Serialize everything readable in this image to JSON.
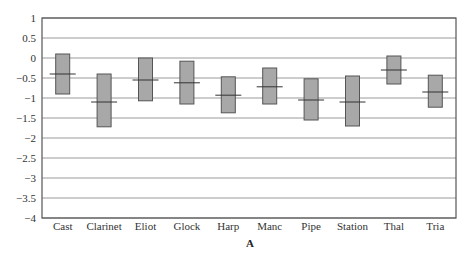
{
  "chart_data": {
    "type": "box",
    "title": "",
    "xlabel": "A",
    "ylabel": "",
    "ylim": [
      -4,
      1
    ],
    "yticks": [
      1,
      0.5,
      0,
      -0.5,
      -1,
      -1.5,
      -2,
      -2.5,
      -3,
      -3.5,
      -4
    ],
    "ytick_labels": [
      "1",
      "0.5",
      "0",
      "−0.5",
      "−1",
      "−1.5",
      "−2",
      "−2.5",
      "−3",
      "−3.5",
      "−4"
    ],
    "grid": true,
    "categories": [
      "Cast",
      "Clarinet",
      "Eliot",
      "Glock",
      "Harp",
      "Manc",
      "Pipe",
      "Station",
      "Thal",
      "Tria"
    ],
    "series": [
      {
        "name": "upper",
        "values": [
          0.1,
          -0.4,
          0.0,
          -0.08,
          -0.47,
          -0.25,
          -0.52,
          -0.45,
          0.05,
          -0.43
        ]
      },
      {
        "name": "lower",
        "values": [
          -0.9,
          -1.72,
          -1.07,
          -1.15,
          -1.37,
          -1.15,
          -1.55,
          -1.7,
          -0.65,
          -1.23
        ]
      },
      {
        "name": "mean",
        "values": [
          -0.4,
          -1.1,
          -0.55,
          -0.62,
          -0.93,
          -0.72,
          -1.05,
          -1.1,
          -0.3,
          -0.85
        ]
      }
    ],
    "colors": {
      "box_fill": "#a8a8a8",
      "box_stroke": "#555555",
      "grid": "#9a9a9a",
      "axis": "#555555",
      "mean_line": "#333333"
    }
  }
}
